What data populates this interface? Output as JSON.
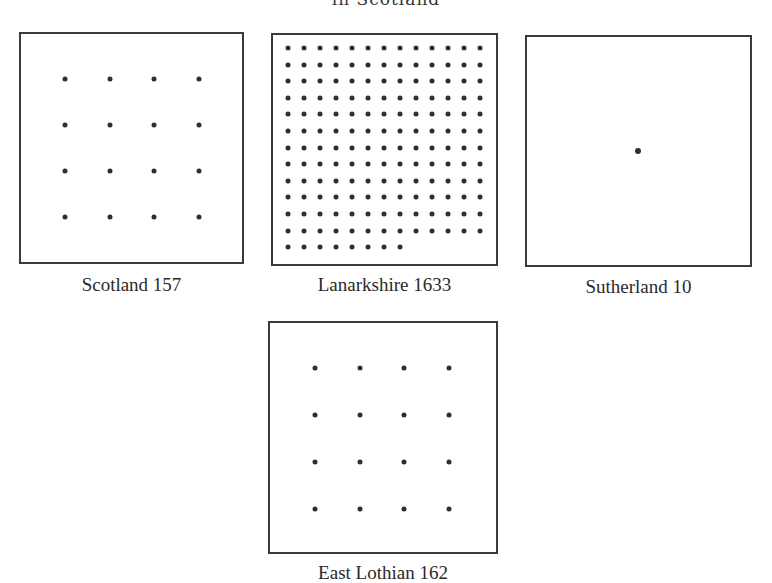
{
  "title": "in Scotland",
  "panels": [
    {
      "id": "scotland",
      "label": "Scotland 157",
      "region": "Scotland",
      "value": 157,
      "dots": 16,
      "grid": {
        "cols": 4,
        "rows": 4
      }
    },
    {
      "id": "lanarkshire",
      "label": "Lanarkshire 1633",
      "region": "Lanarkshire",
      "value": 1633,
      "dots": 164,
      "grid": {
        "cols": 13,
        "rows": 13,
        "last_row_count": 8
      }
    },
    {
      "id": "sutherland",
      "label": "Sutherland 10",
      "region": "Sutherland",
      "value": 10,
      "dots": 1,
      "grid": {
        "cols": 1,
        "rows": 1
      }
    },
    {
      "id": "east-lothian",
      "label": "East Lothian 162",
      "region": "East Lothian",
      "value": 162,
      "dots": 16,
      "grid": {
        "cols": 4,
        "rows": 4
      }
    }
  ],
  "chart_data": {
    "type": "dot-density",
    "title": "in Scotland",
    "categories": [
      "Scotland",
      "Lanarkshire",
      "Sutherland",
      "East Lothian"
    ],
    "values": [
      157,
      1633,
      10,
      162
    ],
    "dots_per_panel": [
      16,
      164,
      1,
      16
    ],
    "unit_note": "each dot represents roughly 10 units"
  }
}
